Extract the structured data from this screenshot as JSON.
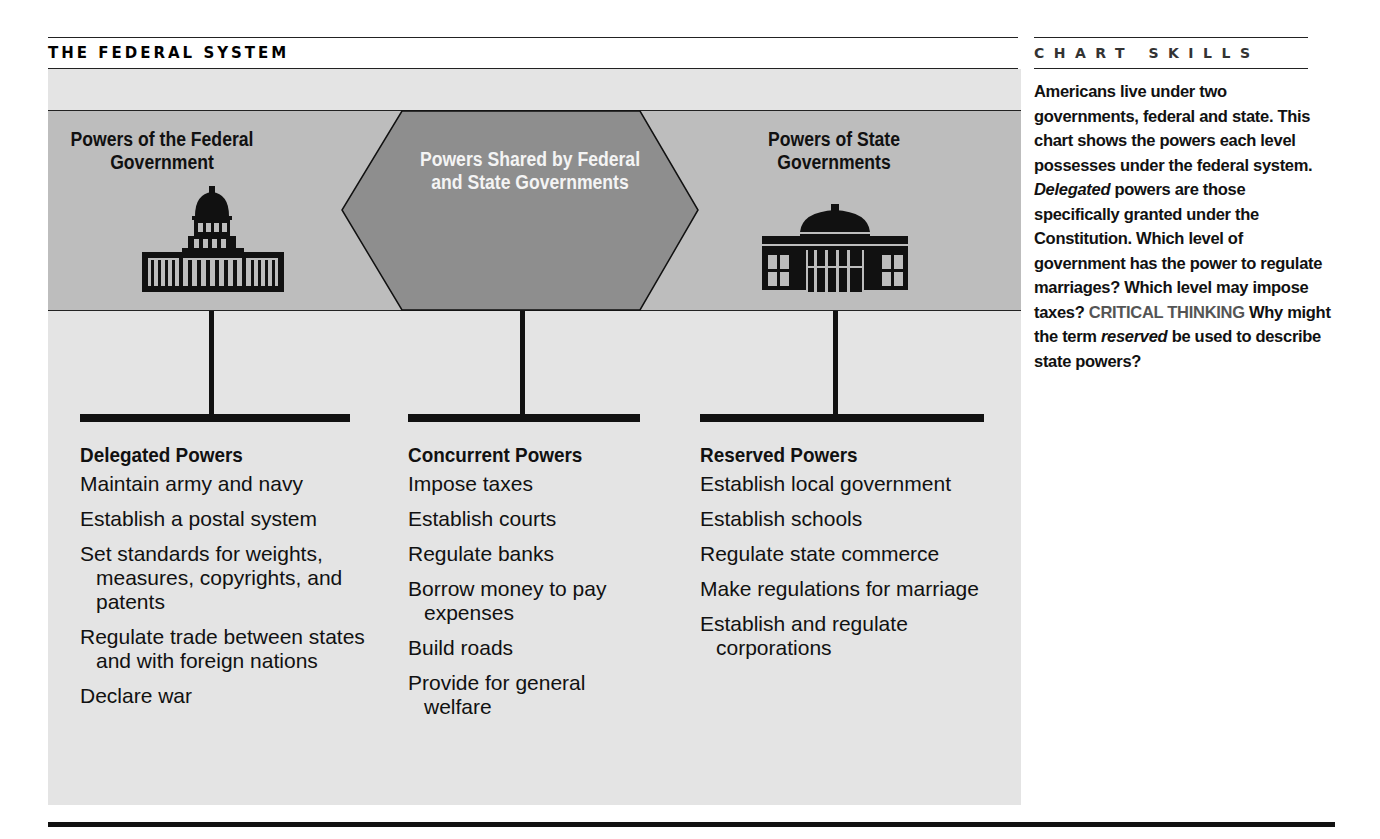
{
  "title": "THE FEDERAL SYSTEM",
  "sidebar": {
    "heading": "CHART SKILLS",
    "text_part1": "Americans live under two governments, federal and state. This chart shows the powers each level possesses under the federal system. ",
    "italic1": "Delegated",
    "text_part2": " powers are those specifically granted under the Constitution. Which level of government has the power to regulate marriages? Which level may impose taxes? ",
    "critical_label": "CRITICAL THINKING",
    "text_part3": " Why might the term ",
    "italic2": "reserved",
    "text_part4": " be used to describe state powers?"
  },
  "colors": {
    "band": "#bdbdbd",
    "hexagon": "#8e8e8e",
    "panel": "#e4e4e4",
    "ink": "#111111"
  },
  "headers": {
    "federal": "Powers of the Federal Government",
    "shared": "Powers Shared by Federal and State Governments",
    "state": "Powers of State Governments"
  },
  "icons": {
    "federal": "capitol-building-icon",
    "state": "statehouse-icon"
  },
  "columns": [
    {
      "title": "Delegated Powers",
      "items": [
        "Maintain army and navy",
        "Establish a postal system",
        "Set standards for weights, measures, copyrights, and patents",
        "Regulate trade between states and with foreign nations",
        "Declare war"
      ]
    },
    {
      "title": "Concurrent Powers",
      "items": [
        "Impose taxes",
        "Establish courts",
        "Regulate banks",
        "Borrow money to pay expenses",
        "Build roads",
        "Provide for general welfare"
      ]
    },
    {
      "title": "Reserved Powers",
      "items": [
        "Establish local government",
        "Establish schools",
        "Regulate state commerce",
        "Make regulations for marriage",
        "Establish and regulate corporations"
      ]
    }
  ]
}
